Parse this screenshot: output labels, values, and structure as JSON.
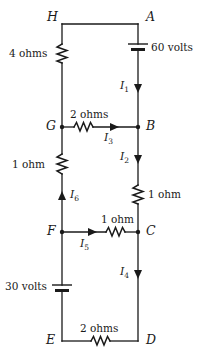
{
  "figure": {
    "type": "electrical-circuit-schematic",
    "background_color": "#ffffff",
    "wire_color": "#1a1a1a"
  },
  "nodes": [
    {
      "id": "H",
      "label": "H",
      "x": 62,
      "y": 24
    },
    {
      "id": "A",
      "label": "A",
      "x": 138,
      "y": 24
    },
    {
      "id": "G",
      "label": "G",
      "x": 62,
      "y": 127
    },
    {
      "id": "B",
      "label": "B",
      "x": 138,
      "y": 127
    },
    {
      "id": "F",
      "label": "F",
      "x": 62,
      "y": 232
    },
    {
      "id": "C",
      "label": "C",
      "x": 138,
      "y": 232
    },
    {
      "id": "E",
      "label": "E",
      "x": 62,
      "y": 341
    },
    {
      "id": "D",
      "label": "D",
      "x": 138,
      "y": 341
    }
  ],
  "components": [
    {
      "id": "r-HG",
      "kind": "resistor",
      "label": "4 ohms",
      "orientation": "vertical",
      "branch": "H-G"
    },
    {
      "id": "bat-A",
      "kind": "battery",
      "label": "60 volts",
      "orientation": "vertical",
      "branch": "A-B"
    },
    {
      "id": "r-GB",
      "kind": "resistor",
      "label": "2 ohms",
      "orientation": "horizontal",
      "branch": "G-B"
    },
    {
      "id": "r-GF",
      "kind": "resistor",
      "label": "1 ohm",
      "orientation": "vertical",
      "branch": "G-F"
    },
    {
      "id": "r-BC",
      "kind": "resistor",
      "label": "1 ohm",
      "orientation": "vertical",
      "branch": "B-C"
    },
    {
      "id": "r-FC",
      "kind": "resistor",
      "label": "1 ohm",
      "orientation": "horizontal",
      "branch": "F-C"
    },
    {
      "id": "bat-F",
      "kind": "battery",
      "label": "30 volts",
      "orientation": "vertical",
      "branch": "F-E"
    },
    {
      "id": "r-ED",
      "kind": "resistor",
      "label": "2 ohms",
      "orientation": "horizontal",
      "branch": "E-D"
    }
  ],
  "currents": [
    {
      "id": "I1",
      "label": "I",
      "subscript": "1",
      "direction": "down",
      "branch": "A-B"
    },
    {
      "id": "I2",
      "label": "I",
      "subscript": "2",
      "direction": "down",
      "branch": "B-C"
    },
    {
      "id": "I3",
      "label": "I",
      "subscript": "3",
      "direction": "left",
      "branch": "B-G"
    },
    {
      "id": "I4",
      "label": "I",
      "subscript": "4",
      "direction": "down",
      "branch": "C-D"
    },
    {
      "id": "I5",
      "label": "I",
      "subscript": "5",
      "direction": "right",
      "branch": "F-C"
    },
    {
      "id": "I6",
      "label": "I",
      "subscript": "6",
      "direction": "up",
      "branch": "F-G"
    }
  ],
  "labels": {
    "node_H": "H",
    "node_A": "A",
    "node_G": "G",
    "node_B": "B",
    "node_F": "F",
    "node_C": "C",
    "node_E": "E",
    "node_D": "D",
    "res_4_ohms": "4 ohms",
    "bat_60_volts": "60 volts",
    "res_2_ohms_GB": "2 ohms",
    "res_1_ohm_GF": "1 ohm",
    "res_1_ohm_BC": "1 ohm",
    "res_1_ohm_FC": "1 ohm",
    "bat_30_volts": "30 volts",
    "res_2_ohms_ED": "2 ohms",
    "current_I1": "I",
    "current_I1_sub": "1",
    "current_I2": "I",
    "current_I2_sub": "2",
    "current_I3": "I",
    "current_I3_sub": "3",
    "current_I4": "I",
    "current_I4_sub": "4",
    "current_I5": "I",
    "current_I5_sub": "5",
    "current_I6": "I",
    "current_I6_sub": "6"
  }
}
